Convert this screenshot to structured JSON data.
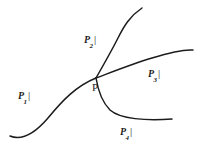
{
  "figure": {
    "junction": {
      "name": "P",
      "label": "P",
      "x": 96,
      "y": 78
    },
    "branches": [
      {
        "id": "branch-1",
        "symbol": "P",
        "subscript": "1",
        "bar": "|",
        "direction": "lower-left",
        "label_x": 18,
        "label_y": 90,
        "path": "M 10 136 C 22 141 36 132 48 118 C 62 101 76 86 96 78"
      },
      {
        "id": "branch-2",
        "symbol": "P",
        "subscript": "2",
        "bar": "|",
        "direction": "upper-right",
        "label_x": 84,
        "label_y": 34,
        "path": "M 96 78 C 104 64 112 50 118 38 C 124 26 130 16 142 8"
      },
      {
        "id": "branch-3",
        "symbol": "P",
        "subscript": "3",
        "bar": "|",
        "direction": "right",
        "label_x": 148,
        "label_y": 68,
        "path": "M 96 78 C 112 72 132 64 152 58 C 168 53 182 49 193 50"
      },
      {
        "id": "branch-4",
        "symbol": "P",
        "subscript": "4",
        "bar": "|",
        "direction": "lower-right",
        "label_x": 120,
        "label_y": 126,
        "path": "M 96 78 C 98 90 101 101 110 110 C 120 119 146 121 172 119"
      }
    ],
    "stroke_color": "#1c1c1c",
    "background_color": "#ffffff",
    "stroke_width": 1.5
  }
}
